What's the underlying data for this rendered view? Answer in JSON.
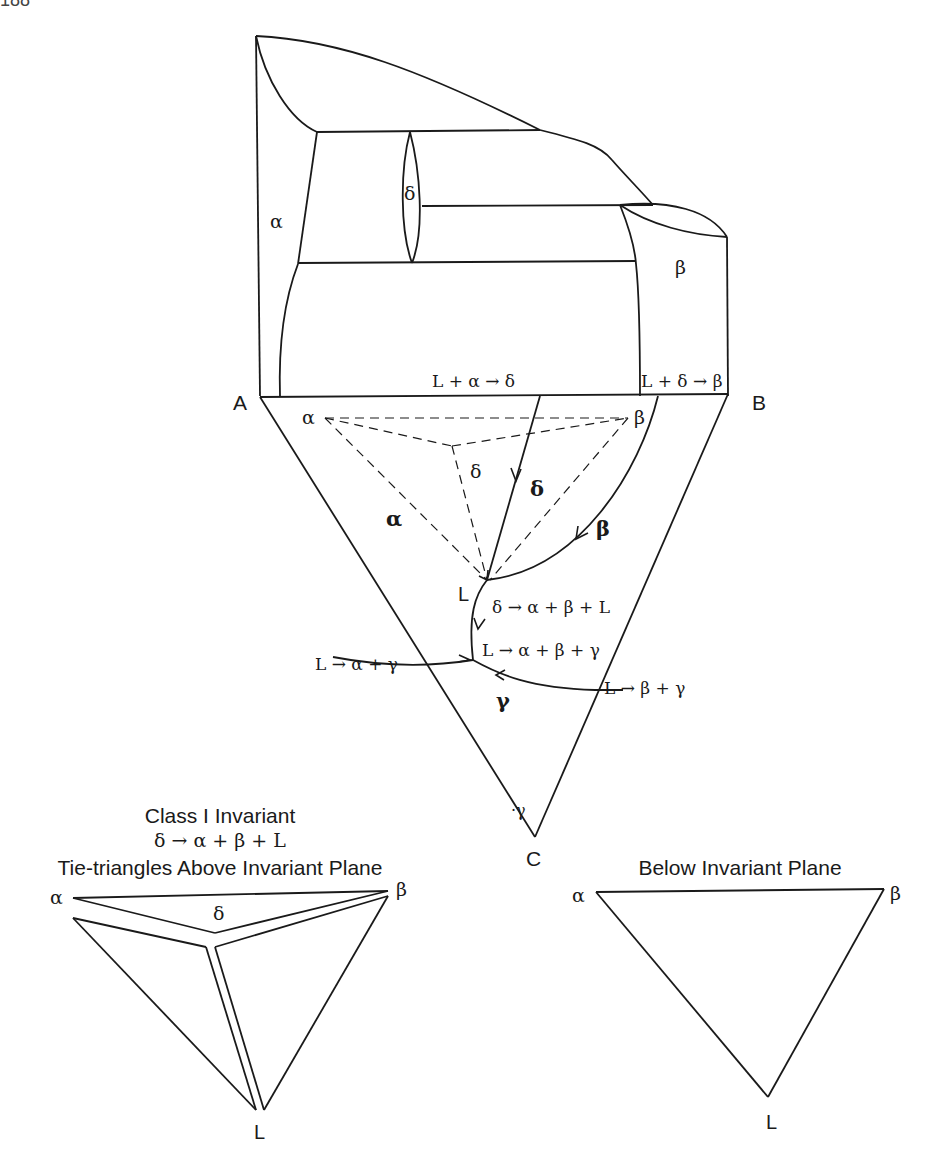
{
  "page": {
    "number_cropped": "188"
  },
  "prism": {
    "phase_labels": {
      "alpha": "α",
      "delta": "δ",
      "beta": "β"
    },
    "reactions": {
      "peritectic_1": "L + α → δ",
      "peritectic_2": "L + δ → β"
    }
  },
  "base_triangle": {
    "vertices": {
      "A": "A",
      "B": "B",
      "C": "C"
    },
    "tie_triangle_labels": {
      "alpha": "α",
      "beta": "β",
      "delta": "δ"
    },
    "field_labels": {
      "alpha": "α",
      "delta": "δ",
      "beta": "β",
      "gamma": "γ"
    },
    "point_L": "L",
    "reactions": {
      "class1": "δ → α + β + L",
      "ternary_eutectic": "L → α + β + γ",
      "binary_ac": "L → α + γ",
      "binary_bc": "L → β + γ"
    },
    "corner_gamma": "·γ"
  },
  "inset_above": {
    "title_line1": "Class I Invariant",
    "title_line2": "δ → α + β + L",
    "title_line3": "Tie-triangles Above Invariant Plane",
    "labels": {
      "alpha": "α",
      "beta": "β",
      "delta": "δ",
      "L": "L"
    }
  },
  "inset_below": {
    "title": "Below Invariant Plane",
    "labels": {
      "alpha": "α",
      "beta": "β",
      "L": "L"
    }
  }
}
